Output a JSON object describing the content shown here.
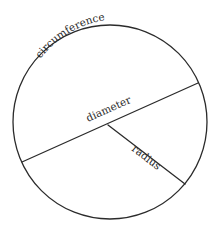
{
  "diagram": {
    "labels": {
      "circumference": "circumference",
      "diameter": "diameter",
      "radius": "radius"
    },
    "geometry": {
      "center": [
        110,
        122
      ],
      "circle_radius": 97,
      "diameter_endpoints": [
        [
          22,
          162
        ],
        [
          198,
          83
        ]
      ],
      "radius_endpoints": [
        [
          108,
          125
        ],
        [
          185,
          184
        ]
      ]
    },
    "colors": {
      "stroke": "#2b2b2b",
      "text": "#2a2a2a",
      "background": "#ffffff"
    }
  }
}
